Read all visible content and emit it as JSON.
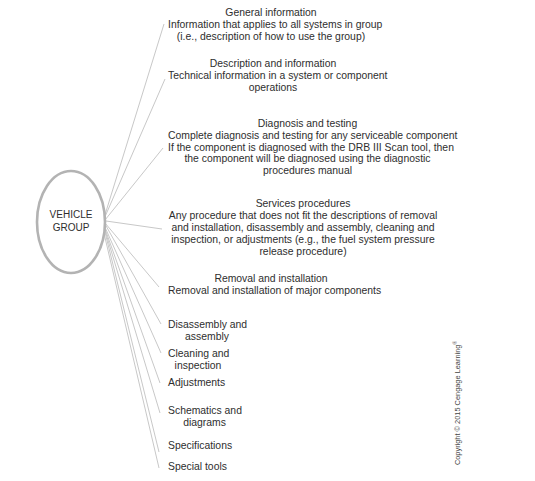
{
  "hub": {
    "line1": "VEHICLE",
    "line2": "GROUP"
  },
  "colors": {
    "connector": "#c8c8c8",
    "ellipse": "#b3b3b3",
    "text": "#2e2e2e"
  },
  "branches": [
    {
      "title": "General information",
      "lines": [
        "Information that applies to all systems in group",
        "(i.e., description of how to use the group)"
      ]
    },
    {
      "title": "Description and information",
      "lines": [
        "Technical information in a system or component",
        "operations"
      ]
    },
    {
      "title": "Diagnosis and testing",
      "lines": [
        "Complete diagnosis and testing for any serviceable component",
        "If the component is diagnosed with the DRB III Scan tool, then",
        "the component will be diagnosed using the diagnostic",
        "procedures manual"
      ]
    },
    {
      "title": "Services procedures",
      "lines": [
        "Any procedure that does not fit the descriptions of removal",
        "and installation, disassembly and assembly, cleaning and",
        "inspection, or adjustments (e.g., the fuel system pressure",
        "release procedure)"
      ]
    },
    {
      "title": "Removal and installation",
      "lines": [
        "Removal and installation of major components"
      ]
    },
    {
      "title": "",
      "lines": [
        "Disassembly and",
        "assembly"
      ]
    },
    {
      "title": "",
      "lines": [
        "Cleaning and",
        "inspection"
      ]
    },
    {
      "title": "",
      "lines": [
        "Adjustments"
      ]
    },
    {
      "title": "",
      "lines": [
        "Schematics and",
        "diagrams"
      ]
    },
    {
      "title": "",
      "lines": [
        "Specifications"
      ]
    },
    {
      "title": "",
      "lines": [
        "Special tools"
      ]
    }
  ],
  "copyright": {
    "text": "Copyright © 2015 Cengage Learning",
    "mark": "®"
  }
}
